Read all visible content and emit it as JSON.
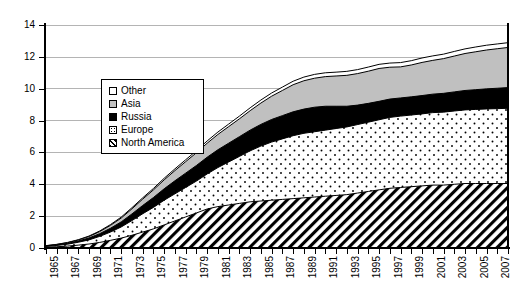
{
  "chart_data": {
    "type": "area",
    "stacked": true,
    "title": "",
    "subtitle": "",
    "xlabel": "",
    "ylabel": "",
    "xlim": [
      1965,
      2008
    ],
    "ylim": [
      0,
      14
    ],
    "ytick_values": [
      0,
      2,
      4,
      6,
      8,
      10,
      12,
      14
    ],
    "ytick_labels": [
      "0",
      "2",
      "4",
      "6",
      "8",
      "10",
      "12",
      "14"
    ],
    "grid": "horizontal",
    "legend_position": "upper-left-inside",
    "x": [
      1965,
      1966,
      1967,
      1968,
      1969,
      1970,
      1971,
      1972,
      1973,
      1974,
      1975,
      1976,
      1977,
      1978,
      1979,
      1980,
      1981,
      1982,
      1983,
      1984,
      1985,
      1986,
      1987,
      1988,
      1989,
      1990,
      1991,
      1992,
      1993,
      1994,
      1995,
      1996,
      1997,
      1998,
      1999,
      2000,
      2001,
      2002,
      2003,
      2004,
      2005,
      2006,
      2007,
      2008
    ],
    "xtick_labels": [
      "1965",
      "1967",
      "1969",
      "1971",
      "1973",
      "1975",
      "1977",
      "1979",
      "1981",
      "1983",
      "1985",
      "1987",
      "1989",
      "1991",
      "1993",
      "1995",
      "1997",
      "1999",
      "2001",
      "2003",
      "2005",
      "2007"
    ],
    "series": [
      {
        "name": "North America",
        "fill": "diagonal-hatch",
        "values": [
          0.05,
          0.08,
          0.12,
          0.18,
          0.25,
          0.35,
          0.48,
          0.62,
          0.8,
          1.0,
          1.2,
          1.45,
          1.7,
          1.95,
          2.2,
          2.45,
          2.6,
          2.7,
          2.8,
          2.9,
          2.95,
          3.0,
          3.05,
          3.1,
          3.15,
          3.2,
          3.25,
          3.3,
          3.35,
          3.45,
          3.55,
          3.65,
          3.75,
          3.8,
          3.85,
          3.9,
          3.95,
          3.95,
          4.0,
          4.05,
          4.05,
          4.05,
          4.05,
          4.05
        ]
      },
      {
        "name": "Europe",
        "fill": "dotted",
        "values": [
          0.05,
          0.08,
          0.12,
          0.18,
          0.26,
          0.38,
          0.52,
          0.7,
          0.92,
          1.15,
          1.35,
          1.55,
          1.7,
          1.85,
          2.0,
          2.2,
          2.45,
          2.7,
          2.95,
          3.2,
          3.45,
          3.65,
          3.8,
          3.95,
          4.05,
          4.1,
          4.15,
          4.2,
          4.25,
          4.3,
          4.35,
          4.4,
          4.45,
          4.48,
          4.5,
          4.52,
          4.55,
          4.58,
          4.6,
          4.62,
          4.65,
          4.68,
          4.7,
          4.72
        ]
      },
      {
        "name": "Russia",
        "fill": "solid-black",
        "values": [
          0.02,
          0.03,
          0.05,
          0.08,
          0.12,
          0.17,
          0.24,
          0.32,
          0.42,
          0.52,
          0.62,
          0.72,
          0.82,
          0.9,
          0.98,
          1.05,
          1.12,
          1.18,
          1.24,
          1.3,
          1.36,
          1.42,
          1.46,
          1.5,
          1.52,
          1.54,
          1.5,
          1.4,
          1.3,
          1.22,
          1.18,
          1.16,
          1.15,
          1.14,
          1.14,
          1.15,
          1.16,
          1.18,
          1.2,
          1.22,
          1.24,
          1.26,
          1.28,
          1.3
        ]
      },
      {
        "name": "Asia",
        "fill": "light-gray",
        "values": [
          0.02,
          0.03,
          0.04,
          0.06,
          0.09,
          0.13,
          0.18,
          0.24,
          0.32,
          0.4,
          0.48,
          0.56,
          0.64,
          0.72,
          0.8,
          0.88,
          0.96,
          1.04,
          1.12,
          1.22,
          1.34,
          1.46,
          1.58,
          1.7,
          1.78,
          1.82,
          1.86,
          1.9,
          1.94,
          1.98,
          2.02,
          2.06,
          2.0,
          1.95,
          2.0,
          2.08,
          2.12,
          2.18,
          2.25,
          2.32,
          2.38,
          2.44,
          2.48,
          2.52
        ]
      },
      {
        "name": "Other",
        "fill": "white",
        "values": [
          0.01,
          0.01,
          0.02,
          0.02,
          0.03,
          0.04,
          0.05,
          0.06,
          0.07,
          0.08,
          0.09,
          0.1,
          0.11,
          0.12,
          0.13,
          0.14,
          0.15,
          0.16,
          0.17,
          0.18,
          0.19,
          0.2,
          0.21,
          0.22,
          0.23,
          0.24,
          0.24,
          0.24,
          0.25,
          0.25,
          0.26,
          0.26,
          0.26,
          0.27,
          0.27,
          0.28,
          0.28,
          0.28,
          0.29,
          0.29,
          0.3,
          0.3,
          0.3,
          0.3
        ]
      }
    ],
    "totals": [
      0.15,
      0.23,
      0.35,
      0.52,
      0.75,
      1.07,
      1.47,
      1.94,
      2.53,
      3.15,
      3.74,
      4.38,
      4.97,
      5.54,
      6.11,
      6.72,
      7.28,
      7.78,
      8.28,
      8.8,
      9.29,
      9.73,
      10.1,
      10.47,
      10.73,
      10.9,
      10.96,
      11.04,
      11.09,
      11.2,
      11.36,
      11.53,
      11.61,
      11.64,
      11.76,
      11.93,
      12.06,
      12.17,
      12.34,
      12.5,
      12.62,
      12.73,
      12.81,
      12.89
    ]
  },
  "legend": {
    "items": [
      {
        "label": "Other",
        "swatch": "white-square-icon"
      },
      {
        "label": "Asia",
        "swatch": "gray-square-icon"
      },
      {
        "label": "Russia",
        "swatch": "black-square-icon"
      },
      {
        "label": "Europe",
        "swatch": "dotted-square-icon"
      },
      {
        "label": "North America",
        "swatch": "hatched-square-icon"
      }
    ]
  },
  "colors": {
    "asia": "#c0c0c0",
    "russia": "#000000",
    "gridline": "#b4b4b4",
    "axis": "#000000",
    "background": "#ffffff"
  }
}
